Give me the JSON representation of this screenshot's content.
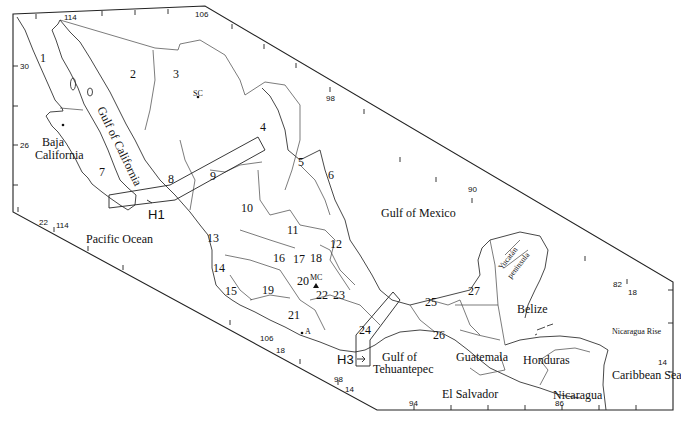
{
  "map": {
    "water_bodies": {
      "gulf_of_california": "Gulf of California",
      "pacific_ocean": "Pacific Ocean",
      "gulf_of_mexico": "Gulf of Mexico",
      "gulf_of_tehuantepec_1": "Gulf of",
      "gulf_of_tehuantepec_2": "Tehuantepec",
      "caribbean_sea": "Caribbean Sea",
      "nicaragua_rise": "Nicaragua Rise"
    },
    "places": {
      "baja_1": "Baja",
      "baja_2": "California",
      "yucatan_1": "Yucatán",
      "yucatan_2": "peninsula",
      "belize": "Belize",
      "guatemala": "Guatemala",
      "honduras": "Honduras",
      "el_salvador": "El Salvador",
      "nicaragua": "Nicaragua",
      "sc": "SC",
      "mc": "MC",
      "a": "A"
    },
    "transects": {
      "h1": "H1",
      "h3": "H3"
    },
    "regions": [
      "1",
      "2",
      "3",
      "4",
      "5",
      "6",
      "7",
      "8",
      "9",
      "10",
      "11",
      "12",
      "13",
      "14",
      "15",
      "16",
      "17",
      "18",
      "19",
      "20",
      "21",
      "22",
      "23",
      "24",
      "25",
      "26",
      "27"
    ],
    "coordinates": {
      "lon_114_top": "114",
      "lon_106_top": "106",
      "lon_98_top": "98",
      "lon_90_top": "90",
      "lon_82": "82",
      "lat_18_right": "18",
      "lat_14_right": "14",
      "lat_30": "30",
      "lat_26": "26",
      "lat_22": "22",
      "lon_114_bottom": "114",
      "lon_106_bottom": "106",
      "lat_18_bottom": "18",
      "lon_98_bottom": "98",
      "lat_14_bottom": "14",
      "lon_94": "94",
      "lon_86": "86"
    }
  }
}
